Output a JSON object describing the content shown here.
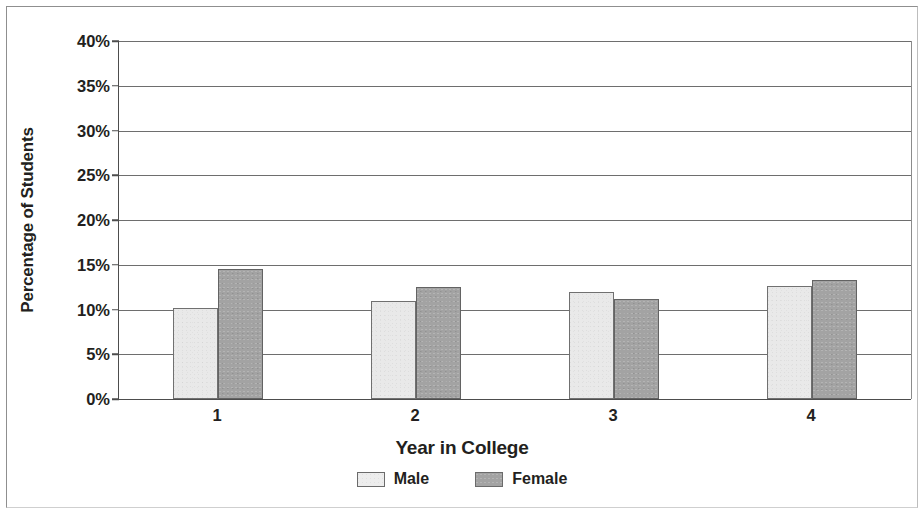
{
  "chart_data": {
    "type": "bar",
    "title": "",
    "subtitle": "",
    "xlabel": "Year in College",
    "ylabel": "Percentage of Students",
    "categories": [
      "1",
      "2",
      "3",
      "4"
    ],
    "series": [
      {
        "name": "Male",
        "color": "#e9e9e9",
        "values": [
          10.2,
          11.0,
          12.0,
          12.6
        ]
      },
      {
        "name": "Female",
        "color": "#a3a3a3",
        "values": [
          14.5,
          12.5,
          11.2,
          13.3
        ]
      }
    ],
    "ylim": [
      0,
      40
    ],
    "ytick_values": [
      40,
      35,
      30,
      25,
      20,
      15,
      10,
      5,
      0
    ],
    "ytick_labels": [
      "40%",
      "35%",
      "30%",
      "25%",
      "20%",
      "15%",
      "10%",
      "5%",
      "0%"
    ],
    "ytick_step": 5,
    "grid": "horizontal",
    "legend_position": "bottom",
    "legend_entries": [
      "Male",
      "Female"
    ],
    "value_unit": "%"
  },
  "legend": {
    "male_label": "Male",
    "female_label": "Female"
  },
  "axes": {
    "y_title": "Percentage of Students",
    "x_title": "Year in College"
  }
}
